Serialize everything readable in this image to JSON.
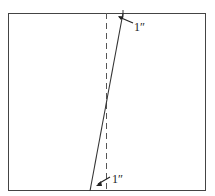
{
  "diagram": {
    "labels": {
      "top": "1″",
      "bottom": "1″"
    },
    "colors": {
      "stroke": "#333333",
      "background": "#ffffff"
    }
  }
}
